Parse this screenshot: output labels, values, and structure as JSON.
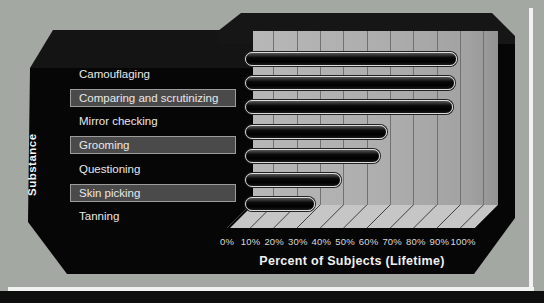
{
  "chart_data": {
    "type": "bar",
    "orientation": "horizontal",
    "title": "",
    "xlabel": "Percent of Subjects (Lifetime)",
    "ylabel": "Substance",
    "categories": [
      "Camouflaging",
      "Comparing and scrutinizing",
      "Mirror checking",
      "Grooming",
      "Questioning",
      "Skin picking",
      "Tanning"
    ],
    "values": [
      88,
      87,
      86,
      58,
      55,
      38,
      27
    ],
    "banded_rows": [
      false,
      true,
      false,
      true,
      false,
      true,
      false
    ],
    "xlim": [
      0,
      100
    ],
    "xtick_step": 10,
    "xticks": [
      "0%",
      "10%",
      "20%",
      "30%",
      "40%",
      "50%",
      "60%",
      "70%",
      "80%",
      "90%",
      "100%"
    ],
    "grid": "vertical-on-back-wall",
    "legend": "none",
    "style": "pseudo-3d slide chart",
    "colors": {
      "background": "#a4a8a3",
      "panel": "#060606",
      "wall": "#adadad",
      "gridline": "#717171",
      "floor": "#c6c6c6",
      "floor_line": "#3f3f3f",
      "bar_fill": "#000000",
      "bar_outline": "#dcdcdc",
      "band_fill": "#4a4a4a",
      "band_border": "#9c9c9c",
      "text": "#e8e8e8",
      "frame_line": "#f2f2f2",
      "bottom_strip": "#0e0e0e"
    }
  }
}
